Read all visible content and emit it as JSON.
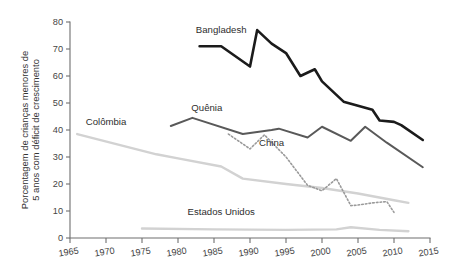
{
  "chart_data": {
    "type": "line",
    "title": "",
    "xlabel": "",
    "ylabel": "Porcentagem de crianças menores de 5 anos com déficit de crescimento",
    "xlim": [
      1965,
      2015
    ],
    "ylim": [
      0,
      80
    ],
    "xticks": [
      1965,
      1970,
      1975,
      1980,
      1985,
      1990,
      1995,
      2000,
      2005,
      2010,
      2015
    ],
    "yticks": [
      0,
      10,
      20,
      30,
      40,
      50,
      60,
      70,
      80
    ],
    "grid": false,
    "legend": "inline-labels",
    "series": [
      {
        "name": "Bangladesh",
        "color": "#1b1b1b",
        "style": "solid",
        "width": 2.6,
        "label_x": 1986,
        "label_y": 76,
        "x": [
          1983,
          1986,
          1990,
          1991,
          1993,
          1995,
          1997,
          1999,
          2000,
          2003,
          2005,
          2007,
          2008,
          2010,
          2011,
          2014
        ],
        "y": [
          71.0,
          71.0,
          63.5,
          77.0,
          72.0,
          68.5,
          60.0,
          62.5,
          58.0,
          50.5,
          49.0,
          47.5,
          43.5,
          43.0,
          41.8,
          36.3
        ]
      },
      {
        "name": "Quênia",
        "color": "#595959",
        "style": "solid",
        "width": 2.0,
        "label_x": 1984,
        "label_y": 47,
        "x": [
          1979,
          1982,
          1989,
          1993,
          1994,
          1998,
          2000,
          2004,
          2006,
          2009,
          2014
        ],
        "y": [
          41.5,
          44.5,
          38.5,
          40.0,
          40.5,
          37.2,
          41.2,
          36.0,
          41.2,
          35.3,
          26.2
        ]
      },
      {
        "name": "China",
        "color": "#9a9a9a",
        "style": "dotted",
        "width": 1.6,
        "label_x": 1993,
        "label_y": 34,
        "x": [
          1987,
          1990,
          1992,
          1995,
          1998,
          2000,
          2002,
          2004,
          2005,
          2007,
          2009,
          2010
        ],
        "y": [
          38.5,
          33.0,
          38.2,
          30.0,
          19.5,
          17.5,
          22.0,
          12.0,
          12.2,
          13.0,
          13.5,
          9.5
        ]
      },
      {
        "name": "Colômbia",
        "color": "#d2d2d2",
        "style": "solid",
        "width": 2.4,
        "label_x": 1970,
        "label_y": 42,
        "x": [
          1966,
          1977,
          1980,
          1986,
          1989,
          1995,
          2000,
          2005,
          2010,
          2012
        ],
        "y": [
          38.5,
          31.0,
          29.5,
          26.5,
          22.0,
          20.0,
          18.5,
          16.5,
          14.0,
          13.0
        ]
      },
      {
        "name": "Estados Unidos",
        "color": "#d2d2d2",
        "style": "solid",
        "width": 2.4,
        "label_x": 1986,
        "label_y": 8.5,
        "x": [
          1975,
          1985,
          1995,
          2002,
          2004,
          2008,
          2012
        ],
        "y": [
          3.5,
          3.2,
          3.0,
          3.2,
          4.0,
          3.0,
          2.5
        ]
      }
    ]
  }
}
